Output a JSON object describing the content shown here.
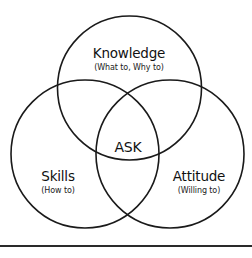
{
  "diagram": {
    "type": "venn",
    "stroke_color": "#1a1a1a",
    "background": "#ffffff",
    "circles": [
      {
        "id": "knowledge",
        "title": "Knowledge",
        "subtitle": "(What to, Why to)",
        "cx": 129.5,
        "cy": 88,
        "r": 72
      },
      {
        "id": "skills",
        "title": "Skills",
        "subtitle": "(How to)",
        "cx": 85,
        "cy": 154,
        "r": 74
      },
      {
        "id": "attitude",
        "title": "Attitude",
        "subtitle": "(Willing to)",
        "cx": 170,
        "cy": 154,
        "r": 74
      }
    ],
    "center_label": "ASK",
    "divider_color": "#2a2a2a"
  }
}
